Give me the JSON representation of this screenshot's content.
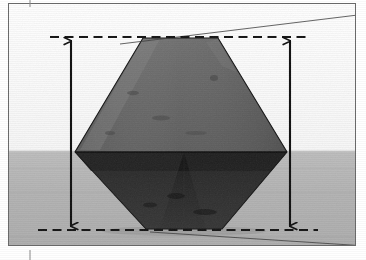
{
  "figure": {
    "kind": "scanned-photograph-with-measurement-annotations",
    "caption_text": "",
    "frame": {
      "border_color": "#6b6b6b",
      "border_width_px": 1,
      "left": 8,
      "top": 3,
      "width": 348,
      "height": 243
    },
    "background": {
      "upper_color": "#fdfdfd",
      "lower_color": "#b4b4b4",
      "horizon_y": 152,
      "description": "light upper half, mid-gray lower half"
    },
    "crystal": {
      "name": "octahedral-crystal",
      "shape": "truncated bipyramid / octahedron silhouette",
      "upper_face_color": "#6f6f6f",
      "lower_face_color": "#2a2a2a",
      "edge_color": "#1a1a1a",
      "vertices": [
        {
          "x": 143,
          "y": 38
        },
        {
          "x": 218,
          "y": 38
        },
        {
          "x": 287,
          "y": 152
        },
        {
          "x": 222,
          "y": 229
        },
        {
          "x": 146,
          "y": 229
        },
        {
          "x": 75,
          "y": 152
        }
      ],
      "mid_edge_left": {
        "x": 75,
        "y": 152
      },
      "mid_edge_right": {
        "x": 287,
        "y": 152
      }
    },
    "dashed_lines": [
      {
        "name": "upper-reference-line",
        "y": 37,
        "x_start": 50,
        "x_end": 310,
        "color": "#111111",
        "dash": "8 5",
        "width": 2.2
      },
      {
        "name": "lower-reference-line",
        "y": 230,
        "x_start": 38,
        "x_end": 318,
        "color": "#111111",
        "dash": "8 5",
        "width": 2.2
      }
    ],
    "arrows": [
      {
        "name": "left-height-arrow",
        "x": 71,
        "y_top": 38,
        "y_bottom": 229,
        "double_headed": true,
        "color": "#0d0d0d",
        "width": 2.1
      },
      {
        "name": "right-height-arrow",
        "x": 290,
        "y_top": 38,
        "y_bottom": 229,
        "double_headed": true,
        "color": "#0d0d0d",
        "width": 2.1
      }
    ],
    "guide_lines": [
      {
        "name": "upper-sight-line",
        "x1": 120,
        "y1": 44,
        "x2": 366,
        "y2": 14,
        "color": "#3a3a3a",
        "width": 0.8
      },
      {
        "name": "lower-sight-line",
        "x1": 150,
        "y1": 232,
        "x2": 366,
        "y2": 246,
        "color": "#3a3a3a",
        "width": 0.8
      }
    ],
    "tick_marks": [
      {
        "name": "top-crop-tick",
        "x": 30,
        "y1": 0,
        "y2": 8,
        "color": "#8a8a8a"
      },
      {
        "name": "bottom-crop-tick",
        "x": 30,
        "y1": 250,
        "y2": 260,
        "color": "#8a8a8a"
      },
      {
        "name": "right-top-crop-tick",
        "x": 356,
        "y1": 14,
        "y2": 14,
        "color": "#8a8a8a"
      }
    ],
    "labels": {
      "none_visible": ""
    }
  }
}
